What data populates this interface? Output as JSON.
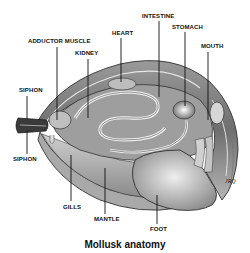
{
  "figure": {
    "title": "Mollusk anatomy",
    "signature": "JRQ",
    "labels": {
      "adductor_muscle": "ADDUCTOR MUSCLE",
      "kidney": "KIDNEY",
      "heart": "HEART",
      "intestine": "INTESTINE",
      "stomach": "STOMACH",
      "mouth": "MOUTH",
      "siphon_top": "SIPHON",
      "siphon_bottom": "SIPHON",
      "gills": "GILLS",
      "mantle": "MANTLE",
      "foot": "FOOT"
    },
    "colors": {
      "ink": "#111111",
      "shell_dark": "#4a4a4a",
      "shell_mid": "#8c8c8c",
      "tissue_light": "#d9d9d9",
      "background": "#ffffff"
    }
  }
}
